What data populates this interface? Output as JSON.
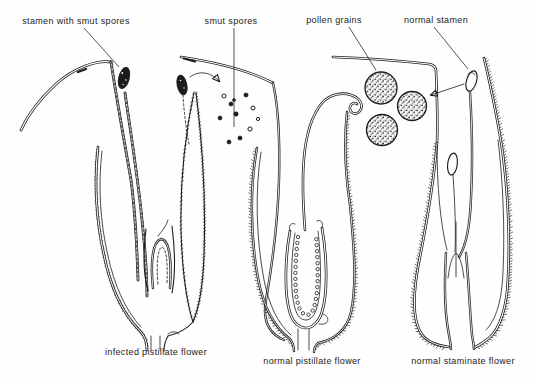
{
  "figure": {
    "background_color": "#fefefe",
    "ink_color": "#1d1d1d",
    "labels": {
      "stamen_with_smut_spores": "stamen with smut spores",
      "smut_spores": "smut spores",
      "pollen_grains": "pollen grains",
      "normal_stamen": "normal stamen"
    },
    "captions": {
      "infected_pistillate_flower": "infected pistillate flower",
      "normal_pistillate_flower": "normal pistillate flower",
      "normal_staminate_flower": "normal staminate flower"
    }
  }
}
